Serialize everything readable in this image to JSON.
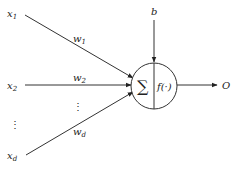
{
  "diagram": {
    "type": "perceptron",
    "inputs": [
      {
        "base": "x",
        "sub": "1",
        "weight_base": "w",
        "weight_sub": "1"
      },
      {
        "base": "x",
        "sub": "2",
        "weight_base": "w",
        "weight_sub": "2"
      },
      {
        "base": "x",
        "sub": "d",
        "weight_base": "w",
        "weight_sub": "d"
      }
    ],
    "ellipsis": "⋮",
    "bias": "b",
    "neuron": {
      "sum_symbol": "∑",
      "activation": "f(·)"
    },
    "output": "O",
    "colors": {
      "stroke": "#333333",
      "text": "#222222",
      "background": "#ffffff"
    }
  }
}
